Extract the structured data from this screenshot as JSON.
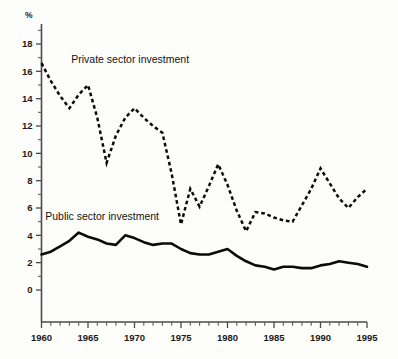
{
  "chart_data": {
    "type": "line",
    "title": "",
    "subtitle": "",
    "xlabel": "",
    "ylabel": "",
    "yunit": "%",
    "xlim": [
      1960,
      1995
    ],
    "ylim": [
      0,
      19
    ],
    "grid": false,
    "legend_position": "inline-annotation",
    "y_ticks": [
      "0",
      "2",
      "4",
      "6",
      "8",
      "10",
      "12",
      "14",
      "16",
      "18"
    ],
    "y_tick_values": [
      0,
      2,
      4,
      6,
      8,
      10,
      12,
      14,
      16,
      18
    ],
    "y_minor_step": 1,
    "x_ticks": [
      "1960",
      "1965",
      "1970",
      "1975",
      "1980",
      "1985",
      "1990",
      "1995"
    ],
    "x_tick_values": [
      1960,
      1965,
      1970,
      1975,
      1980,
      1985,
      1990,
      1995
    ],
    "x_minor_step": 1,
    "x": [
      1960,
      1961,
      1962,
      1963,
      1964,
      1965,
      1966,
      1967,
      1968,
      1969,
      1970,
      1971,
      1972,
      1973,
      1974,
      1975,
      1976,
      1977,
      1978,
      1979,
      1980,
      1981,
      1982,
      1983,
      1984,
      1985,
      1986,
      1987,
      1988,
      1989,
      1990,
      1991,
      1992,
      1993,
      1994,
      1995
    ],
    "series": [
      {
        "name": "Private sector investment",
        "style": "dashed",
        "color": "#0b0b0b",
        "label_x": 1963.2,
        "label_y": 16.6,
        "values": [
          16.6,
          15.3,
          14.2,
          13.3,
          14.3,
          15.0,
          12.6,
          9.3,
          11.3,
          12.6,
          13.3,
          12.6,
          12.0,
          11.5,
          8.5,
          4.8,
          7.4,
          6.1,
          7.6,
          9.2,
          7.7,
          5.8,
          4.3,
          5.7,
          5.6,
          5.3,
          5.1,
          5.0,
          6.2,
          7.4,
          8.9,
          7.8,
          6.7,
          6.0,
          6.8,
          7.4
        ]
      },
      {
        "name": "Public sector investment",
        "style": "solid",
        "color": "#0b0b0b",
        "label_x": 1960.4,
        "label_y": 5.1,
        "values": [
          2.6,
          2.8,
          3.2,
          3.6,
          4.2,
          3.9,
          3.7,
          3.4,
          3.3,
          4.0,
          3.8,
          3.5,
          3.3,
          3.4,
          3.4,
          3.0,
          2.7,
          2.6,
          2.6,
          2.8,
          3.0,
          2.5,
          2.1,
          1.8,
          1.7,
          1.5,
          1.7,
          1.7,
          1.6,
          1.6,
          1.8,
          1.9,
          2.1,
          2.0,
          1.9,
          1.7
        ]
      }
    ]
  }
}
